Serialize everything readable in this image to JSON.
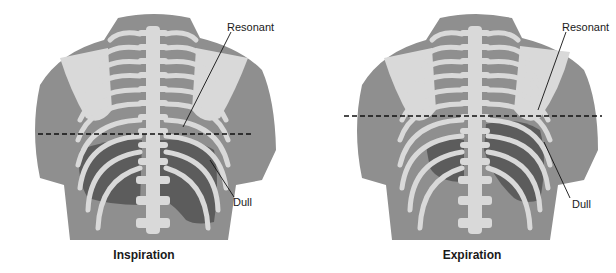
{
  "figure": {
    "colors": {
      "skin": "#8f8f8f",
      "skin_dark": "#7a7a7a",
      "bone": "#d9d9d9",
      "dull_region": "#5c5c5c",
      "dashed_line": "#111111",
      "background": "#ffffff"
    },
    "panels": [
      {
        "id": "inspiration",
        "caption": "Inspiration",
        "labels": {
          "upper": "Resonant",
          "lower": "Dull"
        }
      },
      {
        "id": "expiration",
        "caption": "Expiration",
        "labels": {
          "upper": "Resonant",
          "lower": "Dull"
        }
      }
    ]
  }
}
